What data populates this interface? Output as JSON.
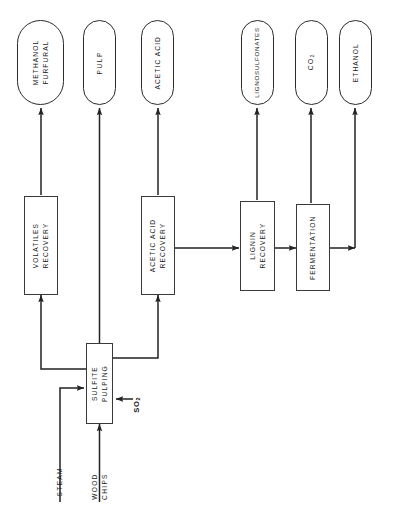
{
  "diagram": {
    "orientation": "rotated-90-ccw",
    "line_color": "#222222",
    "box_fill": "#ffffff"
  },
  "products": [
    {
      "id": "methanol-furfural",
      "label": "METHANOL\nFURFURAL",
      "shape": "stadium"
    },
    {
      "id": "pulp",
      "label": "PULP",
      "shape": "stadium"
    },
    {
      "id": "acetic-acid",
      "label": "ACETIC ACID",
      "shape": "stadium"
    },
    {
      "id": "lignosulfonates",
      "label": "LIGNOSULFONATES",
      "shape": "stadium"
    },
    {
      "id": "co2",
      "label": "CO",
      "sub": "2",
      "shape": "stadium"
    },
    {
      "id": "ethanol",
      "label": "ETHANOL",
      "shape": "stadium"
    }
  ],
  "processes": [
    {
      "id": "volatiles-recovery",
      "label": "VOLATILES\nRECOVERY",
      "shape": "rect"
    },
    {
      "id": "acetic-acid-recovery",
      "label": "ACETIC ACID\nRECOVERY",
      "shape": "rect"
    },
    {
      "id": "lignin-recovery",
      "label": "LIGNIN\nRECOVERY",
      "shape": "rect"
    },
    {
      "id": "fermentation",
      "label": "FERMENTATION",
      "shape": "rect"
    },
    {
      "id": "sulfite-pulping",
      "label": "SULFITE\nPULPING",
      "shape": "rect"
    }
  ],
  "feeds": [
    {
      "id": "steam",
      "label": "STEAM"
    },
    {
      "id": "wood-chips",
      "label": "WOOD\nCHIPS"
    },
    {
      "id": "so2",
      "label": "SO",
      "sub": "2",
      "bold": true
    }
  ],
  "flows": [
    {
      "from": "steam",
      "to": "sulfite-pulping"
    },
    {
      "from": "wood-chips",
      "to": "sulfite-pulping"
    },
    {
      "from": "so2",
      "to": "sulfite-pulping"
    },
    {
      "from": "sulfite-pulping",
      "to": "pulp"
    },
    {
      "from": "sulfite-pulping",
      "to": "volatiles-recovery"
    },
    {
      "from": "sulfite-pulping",
      "to": "acetic-acid-recovery"
    },
    {
      "from": "volatiles-recovery",
      "to": "methanol-furfural"
    },
    {
      "from": "acetic-acid-recovery",
      "to": "acetic-acid"
    },
    {
      "from": "acetic-acid-recovery",
      "to": "lignin-recovery"
    },
    {
      "from": "lignin-recovery",
      "to": "lignosulfonates"
    },
    {
      "from": "lignin-recovery",
      "to": "fermentation"
    },
    {
      "from": "fermentation",
      "to": "co2"
    },
    {
      "from": "fermentation",
      "to": "ethanol"
    }
  ]
}
